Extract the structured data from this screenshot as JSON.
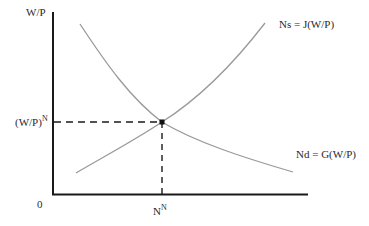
{
  "diagram": {
    "type": "labor-market-equilibrium",
    "y_axis_label": "W/P",
    "origin_label": "0",
    "equilibrium_wage_label": {
      "base": "(W/P)",
      "sup": "N"
    },
    "equilibrium_employment_label": {
      "base": "N",
      "sup": "N"
    },
    "curves": [
      {
        "name": "labor-supply",
        "label": "Ns = J(W/P)",
        "shape": "upward-sloping convex"
      },
      {
        "name": "labor-demand",
        "label": "Nd = G(W/P)",
        "shape": "downward-sloping convex"
      }
    ],
    "colors": {
      "axis": "#1a1a1a",
      "curve": "#9a9a9a",
      "dashed_guide": "#1a1a1a",
      "equilibrium_point": "#111111"
    }
  }
}
